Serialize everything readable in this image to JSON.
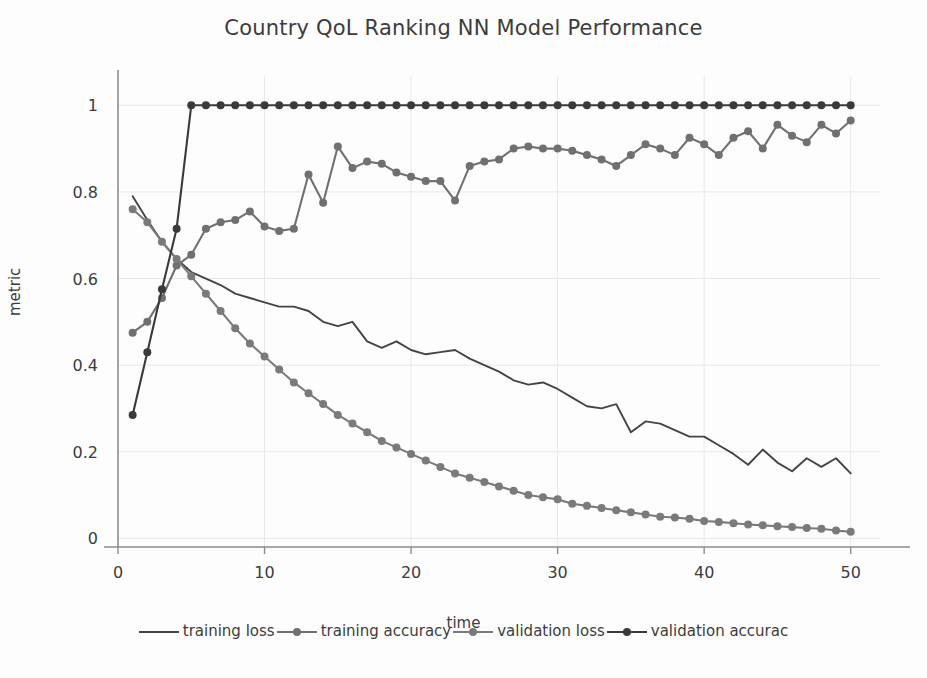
{
  "chart_data": {
    "type": "line",
    "title": "Country QoL Ranking NN Model Performance",
    "xlabel": "time",
    "ylabel": "metric",
    "xlim": [
      0,
      52
    ],
    "ylim": [
      -0.02,
      1.04
    ],
    "xticks": [
      0,
      10,
      20,
      30,
      40,
      50
    ],
    "yticks": [
      "0",
      "0.2",
      "0.4",
      "0.6",
      "0.8",
      "1"
    ],
    "grid": true,
    "legend_position": "bottom",
    "x": [
      1,
      2,
      3,
      4,
      5,
      6,
      7,
      8,
      9,
      10,
      11,
      12,
      13,
      14,
      15,
      16,
      17,
      18,
      19,
      20,
      21,
      22,
      23,
      24,
      25,
      26,
      27,
      28,
      29,
      30,
      31,
      32,
      33,
      34,
      35,
      36,
      37,
      38,
      39,
      40,
      41,
      42,
      43,
      44,
      45,
      46,
      47,
      48,
      49,
      50
    ],
    "series": [
      {
        "name": "training loss",
        "color": "#444444",
        "marker": "none",
        "values": [
          0.79,
          0.735,
          0.685,
          0.645,
          0.615,
          0.6,
          0.585,
          0.565,
          0.555,
          0.545,
          0.535,
          0.535,
          0.525,
          0.5,
          0.49,
          0.5,
          0.455,
          0.44,
          0.455,
          0.435,
          0.425,
          0.43,
          0.435,
          0.415,
          0.4,
          0.385,
          0.365,
          0.355,
          0.36,
          0.345,
          0.325,
          0.305,
          0.3,
          0.31,
          0.245,
          0.27,
          0.265,
          0.25,
          0.235,
          0.235,
          0.215,
          0.195,
          0.17,
          0.205,
          0.175,
          0.155,
          0.185,
          0.165,
          0.185,
          0.15
        ]
      },
      {
        "name": "training accuracy",
        "color": "#707070",
        "marker": "circle",
        "values": [
          0.475,
          0.5,
          0.555,
          0.63,
          0.655,
          0.715,
          0.73,
          0.735,
          0.755,
          0.72,
          0.71,
          0.715,
          0.84,
          0.775,
          0.905,
          0.855,
          0.87,
          0.865,
          0.845,
          0.835,
          0.825,
          0.825,
          0.78,
          0.86,
          0.87,
          0.875,
          0.9,
          0.905,
          0.9,
          0.9,
          0.895,
          0.885,
          0.875,
          0.86,
          0.885,
          0.91,
          0.9,
          0.885,
          0.925,
          0.91,
          0.885,
          0.925,
          0.94,
          0.9,
          0.955,
          0.93,
          0.915,
          0.955,
          0.935,
          0.965
        ]
      },
      {
        "name": "validation loss",
        "color": "#7a7a7a",
        "marker": "circle",
        "values": [
          0.76,
          0.73,
          0.685,
          0.645,
          0.605,
          0.565,
          0.525,
          0.485,
          0.45,
          0.42,
          0.39,
          0.36,
          0.335,
          0.31,
          0.285,
          0.265,
          0.245,
          0.225,
          0.21,
          0.195,
          0.18,
          0.165,
          0.15,
          0.14,
          0.13,
          0.12,
          0.11,
          0.1,
          0.095,
          0.09,
          0.08,
          0.075,
          0.07,
          0.065,
          0.06,
          0.055,
          0.05,
          0.048,
          0.045,
          0.04,
          0.038,
          0.035,
          0.032,
          0.03,
          0.028,
          0.026,
          0.024,
          0.022,
          0.018,
          0.015
        ]
      },
      {
        "name": "validation accurac",
        "color": "#3a3a3a",
        "marker": "circle",
        "values": [
          0.285,
          0.43,
          0.575,
          0.715,
          1.0,
          1.0,
          1.0,
          1.0,
          1.0,
          1.0,
          1.0,
          1.0,
          1.0,
          1.0,
          1.0,
          1.0,
          1.0,
          1.0,
          1.0,
          1.0,
          1.0,
          1.0,
          1.0,
          1.0,
          1.0,
          1.0,
          1.0,
          1.0,
          1.0,
          1.0,
          1.0,
          1.0,
          1.0,
          1.0,
          1.0,
          1.0,
          1.0,
          1.0,
          1.0,
          1.0,
          1.0,
          1.0,
          1.0,
          1.0,
          1.0,
          1.0,
          1.0,
          1.0,
          1.0,
          1.0
        ]
      }
    ]
  },
  "legend": {
    "items": [
      {
        "label": "training loss",
        "color": "#444444",
        "marker": false
      },
      {
        "label": "training accuracy",
        "color": "#707070",
        "marker": true
      },
      {
        "label": "validation loss",
        "color": "#7a7a7a",
        "marker": true
      },
      {
        "label": "validation accurac",
        "color": "#3a3a3a",
        "marker": true
      }
    ]
  },
  "style": {
    "background": "#fdfdfd",
    "grid_color": "#e8e8e8",
    "axis_color": "#8d8d8d",
    "text_color": "#3c3c3c"
  }
}
